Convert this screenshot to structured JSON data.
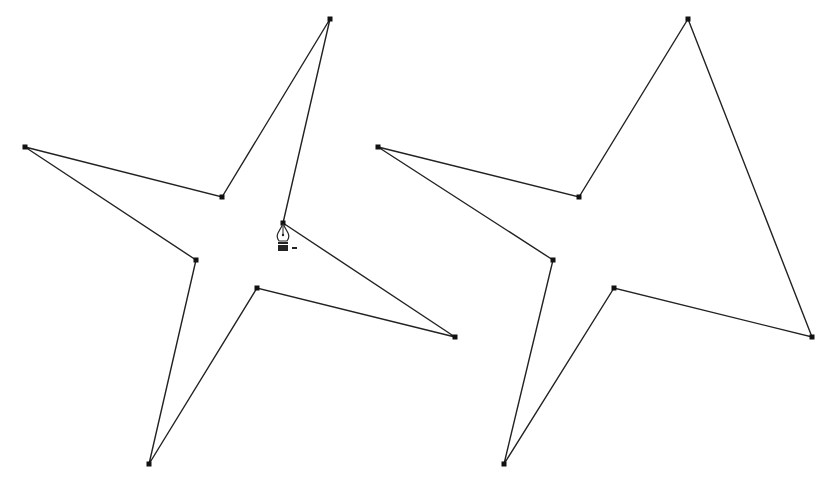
{
  "figure": {
    "stroke_color": "#222222",
    "anchor_color": "#111111",
    "left_path": {
      "points": [
        [
          330,
          19
        ],
        [
          283,
          223
        ],
        [
          455,
          337
        ],
        [
          257,
          288
        ],
        [
          149,
          464
        ],
        [
          196,
          260
        ],
        [
          25,
          147
        ],
        [
          222,
          197
        ]
      ],
      "closed": true
    },
    "right_path": {
      "points": [
        [
          688,
          19
        ],
        [
          812,
          337
        ],
        [
          614,
          288
        ],
        [
          504,
          464
        ],
        [
          553,
          260
        ],
        [
          378,
          147
        ],
        [
          579,
          197
        ]
      ],
      "closed": true
    },
    "cursor": {
      "icon": "pen-delete-anchor-icon",
      "x": 283,
      "y": 223,
      "modifier": "-"
    }
  }
}
